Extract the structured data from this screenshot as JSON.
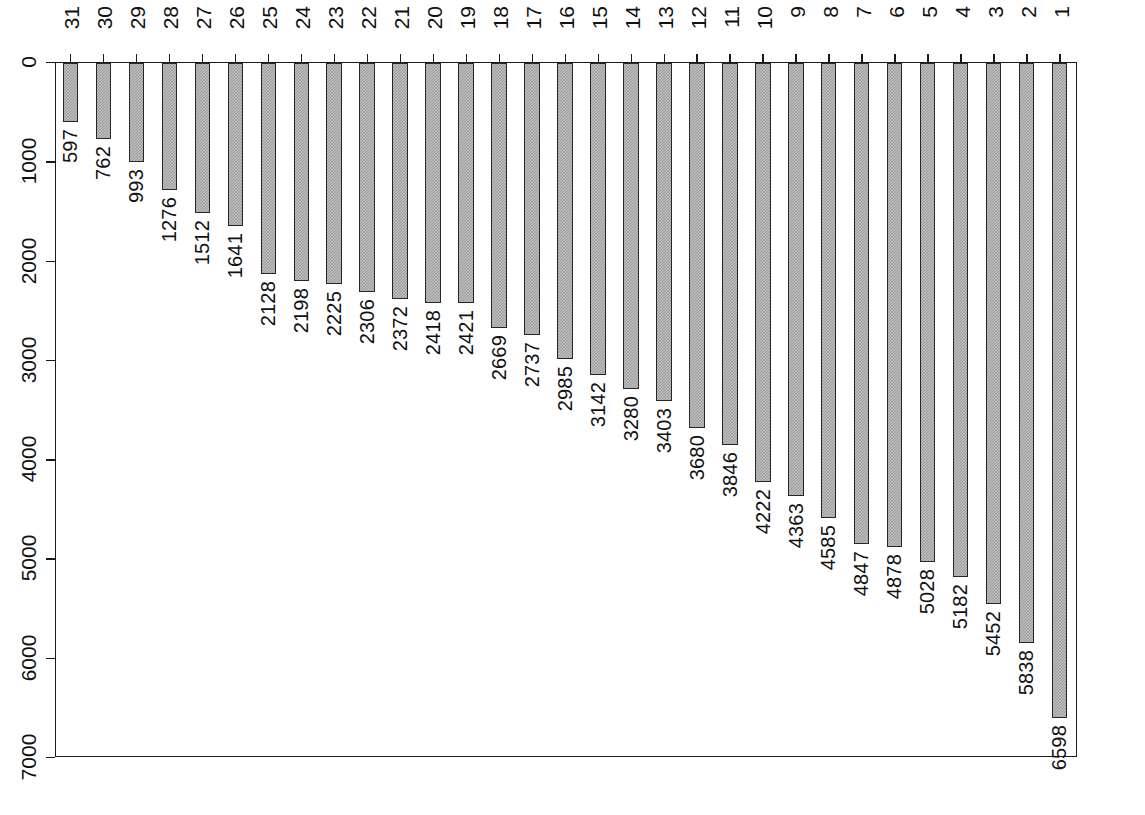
{
  "caption": "附图B−25  21122  每十万研发人员作者异省科技论文数（篇）",
  "axis": {
    "value_ticks": [
      0,
      1000,
      2000,
      3000,
      4000,
      5000,
      6000,
      7000
    ],
    "value_tick_labels": [
      "0",
      "1000",
      "2000",
      "3000",
      "4000",
      "5000",
      "6000",
      "7000"
    ],
    "value_min": 0,
    "value_max": 7000
  },
  "colors": {
    "bar_fill": "#9b9b9b",
    "bar_border": "#262626",
    "frame": "#1a1a1a",
    "text": "#111111",
    "background": "#ffffff"
  },
  "chart_data": {
    "type": "bar",
    "xlabel": "",
    "ylabel": "每十万研发人员作者异省科技论文数（篇）",
    "orientation": "vertical-rotated",
    "grid": false,
    "legend": null,
    "ylim": [
      0,
      7000
    ],
    "ranks": [
      1,
      2,
      3,
      4,
      5,
      6,
      7,
      8,
      9,
      10,
      11,
      12,
      13,
      14,
      15,
      16,
      17,
      18,
      19,
      20,
      21,
      22,
      23,
      24,
      25,
      26,
      27,
      28,
      29,
      30,
      31
    ],
    "categories": [
      "新疆",
      "海南",
      "黑龙江",
      "甘肃",
      "吉林",
      "内蒙古",
      "贵州",
      "青海",
      "宁夏",
      "陕西",
      "北京",
      "山西",
      "广西",
      "西藏",
      "辽宁",
      "云南",
      "湖南",
      "四川",
      "湖北",
      "重庆",
      "天津",
      "河南",
      "江西",
      "河北",
      "上海",
      "山东",
      "安徽",
      "江苏",
      "福建",
      "广东",
      "浙江"
    ],
    "values": [
      6598,
      5838,
      5452,
      5182,
      5028,
      4878,
      4847,
      4585,
      4363,
      4222,
      3846,
      3680,
      3403,
      3280,
      3142,
      2985,
      2737,
      2669,
      2421,
      2418,
      2372,
      2306,
      2225,
      2198,
      2128,
      1641,
      1512,
      1276,
      993,
      762,
      597
    ]
  }
}
